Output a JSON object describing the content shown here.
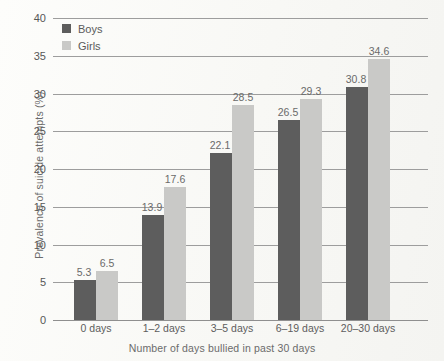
{
  "chart_data": {
    "type": "bar",
    "title": "",
    "xlabel": "Number of days bullied in past 30 days",
    "ylabel": "Prevalence of suicide attempts (%)",
    "categories": [
      "0 days",
      "1–2 days",
      "3–5 days",
      "6–19 days",
      "20–30 days"
    ],
    "series": [
      {
        "name": "Boys",
        "color": "#5d5d5d",
        "values": [
          5.3,
          13.9,
          22.1,
          26.5,
          30.8
        ]
      },
      {
        "name": "Girls",
        "color": "#c9c9c7",
        "values": [
          6.5,
          17.6,
          28.5,
          29.3,
          34.6
        ]
      }
    ],
    "ylim": [
      0,
      40
    ],
    "yticks": [
      0,
      5,
      10,
      15,
      20,
      25,
      30,
      35,
      40
    ],
    "ytick_labels": [
      "0",
      "5",
      "10",
      "15",
      "20",
      "25",
      "30",
      "35",
      "40"
    ],
    "grid": true,
    "legend_position": "top-left",
    "data_labels": [
      [
        "5.3",
        "6.5"
      ],
      [
        "13.9",
        "17.6"
      ],
      [
        "22.1",
        "28.5"
      ],
      [
        "26.5",
        "29.3"
      ],
      [
        "30.8",
        "34.6"
      ]
    ]
  }
}
